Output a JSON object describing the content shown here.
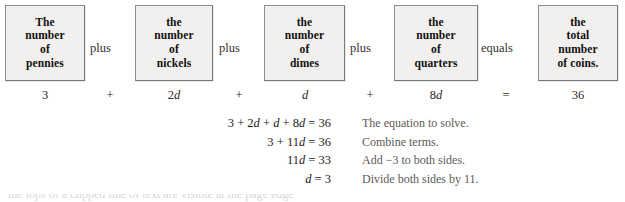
{
  "diagram": {
    "boxes": [
      {
        "id": "pennies",
        "lines": [
          "The",
          "number",
          "of",
          "pennies"
        ],
        "x": 5,
        "y": 5,
        "w": 80,
        "h": 76
      },
      {
        "id": "nickels",
        "lines": [
          "the",
          "number",
          "of",
          "nickels"
        ],
        "x": 135,
        "y": 5,
        "w": 78,
        "h": 76
      },
      {
        "id": "dimes",
        "lines": [
          "the",
          "number",
          "of",
          "dimes"
        ],
        "x": 264,
        "y": 5,
        "w": 81,
        "h": 76
      },
      {
        "id": "quarters",
        "lines": [
          "the",
          "number",
          "of",
          "quarters"
        ],
        "x": 394,
        "y": 5,
        "w": 84,
        "h": 76
      },
      {
        "id": "coins",
        "lines": [
          "the",
          "total",
          "number",
          "of coins."
        ],
        "x": 538,
        "y": 5,
        "w": 80,
        "h": 76
      }
    ],
    "connectors": [
      {
        "id": "plus-1",
        "label": "plus",
        "x": 90,
        "y": 41
      },
      {
        "id": "plus-2",
        "label": "plus",
        "x": 219,
        "y": 41
      },
      {
        "id": "plus-3",
        "label": "plus",
        "x": 350,
        "y": 41
      },
      {
        "id": "equals-1",
        "label": "equals",
        "x": 481,
        "y": 41
      }
    ],
    "values": [
      {
        "id": "pennies-value",
        "text": "3",
        "italic": "",
        "x": 45
      },
      {
        "id": "operator-plus-1",
        "text": "+",
        "italic": "",
        "x": 110
      },
      {
        "id": "nickels-value",
        "text": "2",
        "italic": "d",
        "x": 174
      },
      {
        "id": "operator-plus-2",
        "text": "+",
        "italic": "",
        "x": 239
      },
      {
        "id": "dimes-value",
        "text": "",
        "italic": "d",
        "x": 305
      },
      {
        "id": "operator-plus-3",
        "text": "+",
        "italic": "",
        "x": 370
      },
      {
        "id": "quarters-value",
        "text": "8",
        "italic": "d",
        "x": 436
      },
      {
        "id": "operator-equals",
        "text": "=",
        "italic": "",
        "x": 506
      },
      {
        "id": "total-value",
        "text": "36",
        "italic": "",
        "x": 578
      }
    ]
  },
  "solution": {
    "steps": [
      {
        "lhs": "3 + 2",
        "var1": "d",
        "mid": " + ",
        "var2": "d",
        "tail": " + 8",
        "var3": "d",
        "rhs": " = 36",
        "note": "The equation to solve."
      },
      {
        "lhs": "3 + 11",
        "var1": "d",
        "mid": "",
        "var2": "",
        "tail": "",
        "var3": "",
        "rhs": " = 36",
        "note": "Combine terms."
      },
      {
        "lhs": "11",
        "var1": "d",
        "mid": "",
        "var2": "",
        "tail": "",
        "var3": "",
        "rhs": " = 33",
        "note": "Add  −3 to both sides."
      },
      {
        "lhs": "",
        "var1": "d",
        "mid": "",
        "var2": "",
        "tail": "",
        "var3": "",
        "rhs": " = 3",
        "note": "Divide both sides by 11."
      }
    ]
  },
  "clipped_bottom_line": {
    "text": "the tops of a clipped line of text are visible at the page edge"
  }
}
